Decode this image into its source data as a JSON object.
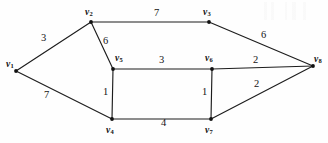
{
  "figure": {
    "name": "weighted-graph",
    "width": 328,
    "height": 143,
    "background_color": "#fefefe",
    "stroke_color": "#1d1d1d",
    "text_color": "#121212"
  },
  "chart_data": {
    "type": "diagram",
    "subtype": "undirected-weighted-graph",
    "title": "",
    "vertices": [
      {
        "id": "v1",
        "label": "v",
        "sub": "1",
        "x": 16,
        "y": 71,
        "label_x": 6,
        "label_y": 60
      },
      {
        "id": "v2",
        "label": "v",
        "sub": "2",
        "x": 91,
        "y": 22,
        "label_x": 85,
        "label_y": 8
      },
      {
        "id": "v3",
        "label": "v",
        "sub": "3",
        "x": 209,
        "y": 22,
        "label_x": 203,
        "label_y": 8
      },
      {
        "id": "v4",
        "label": "v",
        "sub": "4",
        "x": 112,
        "y": 119,
        "label_x": 106,
        "label_y": 126
      },
      {
        "id": "v5",
        "label": "v",
        "sub": "5",
        "x": 113,
        "y": 69,
        "label_x": 115,
        "label_y": 54
      },
      {
        "id": "v6",
        "label": "v",
        "sub": "6",
        "x": 212,
        "y": 69,
        "label_x": 205,
        "label_y": 54
      },
      {
        "id": "v7",
        "label": "v",
        "sub": "7",
        "x": 211,
        "y": 119,
        "label_x": 205,
        "label_y": 126
      },
      {
        "id": "v8",
        "label": "v",
        "sub": "8",
        "x": 313,
        "y": 66,
        "label_x": 314,
        "label_y": 55
      }
    ],
    "edges": [
      {
        "id": "e-v1-v2",
        "from": "v1",
        "to": "v2",
        "weight": 3,
        "weight_x": 41,
        "weight_y": 33
      },
      {
        "id": "e-v1-v4",
        "from": "v1",
        "to": "v4",
        "weight": 7,
        "weight_x": 44,
        "weight_y": 90
      },
      {
        "id": "e-v2-v3",
        "from": "v2",
        "to": "v3",
        "weight": 7,
        "weight_x": 154,
        "weight_y": 8
      },
      {
        "id": "e-v2-v5",
        "from": "v2",
        "to": "v5",
        "weight": 6,
        "weight_x": 103,
        "weight_y": 36
      },
      {
        "id": "e-v3-v8",
        "from": "v3",
        "to": "v8",
        "weight": 6,
        "weight_x": 261,
        "weight_y": 30
      },
      {
        "id": "e-v5-v6",
        "from": "v5",
        "to": "v6",
        "weight": 3,
        "weight_x": 159,
        "weight_y": 55
      },
      {
        "id": "e-v5-v4",
        "from": "v5",
        "to": "v4",
        "weight": 1,
        "weight_x": 103,
        "weight_y": 87
      },
      {
        "id": "e-v6-v7",
        "from": "v6",
        "to": "v7",
        "weight": 1,
        "weight_x": 202,
        "weight_y": 87
      },
      {
        "id": "e-v6-v8",
        "from": "v6",
        "to": "v8",
        "weight": 2,
        "weight_x": 253,
        "weight_y": 55
      },
      {
        "id": "e-v7-v8",
        "from": "v7",
        "to": "v8",
        "weight": 2,
        "weight_x": 254,
        "weight_y": 79
      },
      {
        "id": "e-v4-v7",
        "from": "v4",
        "to": "v7",
        "weight": 4,
        "weight_x": 161,
        "weight_y": 118
      }
    ]
  }
}
